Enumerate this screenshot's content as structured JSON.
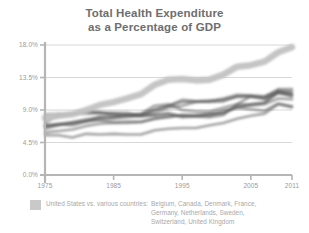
{
  "title": {
    "line1": "Total Health Expenditure",
    "line2": "as a Percentage of GDP"
  },
  "legend": {
    "swatch_color": "#c9c9c9",
    "label": "United States vs. various countries:",
    "countries": "Belgium, Canada, Denmark, France, Germany, Netherlands, Sweden, Switzerland, United Kingdom"
  },
  "axis": {
    "y_ticks": [
      "18.0%",
      "13.5%",
      "9.0%",
      "4.5%",
      "0.0%"
    ],
    "x_ticks": [
      "1975",
      "1985",
      "1995",
      "2005",
      "2011"
    ]
  },
  "colors": {
    "us_line": "#c2c2c2",
    "comparison_line": "#5a5a5a",
    "axis": "#b5b5b5",
    "gridline": "#d8d8d8",
    "title": "#6e6e6e",
    "tick_label": "#9a9a9a",
    "legend_text": "#a8a8a8",
    "background": "#ffffff"
  },
  "chart_data": {
    "type": "line",
    "title": "Total Health Expenditure as a Percentage of GDP",
    "xlabel": "",
    "ylabel": "",
    "xlim": [
      1975,
      2011
    ],
    "ylim": [
      0,
      18
    ],
    "ytick_values": [
      18.0,
      13.5,
      9.0,
      4.5,
      0.0
    ],
    "xtick_values": [
      1975,
      1985,
      1995,
      2005,
      2011
    ],
    "grid": true,
    "legend_position": "below-left",
    "x": [
      1975,
      1977,
      1979,
      1981,
      1983,
      1985,
      1987,
      1989,
      1991,
      1993,
      1995,
      1997,
      1999,
      2001,
      2003,
      2005,
      2007,
      2009,
      2011
    ],
    "series": [
      {
        "name": "United States",
        "color": "#c2c2c2",
        "highlight": true,
        "values": [
          7.9,
          8.2,
          8.4,
          9.0,
          9.7,
          10.1,
          10.6,
          11.2,
          12.5,
          13.2,
          13.3,
          13.1,
          13.2,
          13.9,
          15.0,
          15.2,
          15.7,
          17.0,
          17.7
        ]
      },
      {
        "name": "Belgium",
        "color": "#5a5a5a",
        "values": [
          5.9,
          6.1,
          6.3,
          6.8,
          7.1,
          7.2,
          7.2,
          7.3,
          7.8,
          8.1,
          8.3,
          8.3,
          8.4,
          8.5,
          9.5,
          9.6,
          9.8,
          10.6,
          10.5
        ]
      },
      {
        "name": "Canada",
        "color": "#5a5a5a",
        "values": [
          6.8,
          7.0,
          6.9,
          7.4,
          8.1,
          8.0,
          8.3,
          8.5,
          9.6,
          9.8,
          9.0,
          8.8,
          8.8,
          9.3,
          9.8,
          9.8,
          10.0,
          11.4,
          11.2
        ]
      },
      {
        "name": "Denmark",
        "color": "#5a5a5a",
        "values": [
          7.9,
          8.1,
          8.5,
          8.7,
          8.6,
          8.5,
          8.3,
          8.3,
          8.3,
          8.6,
          8.1,
          8.2,
          8.5,
          8.7,
          9.3,
          9.8,
          10.0,
          11.5,
          10.9
        ]
      },
      {
        "name": "France",
        "color": "#5a5a5a",
        "values": [
          6.4,
          6.9,
          7.3,
          7.7,
          8.0,
          8.1,
          8.3,
          8.4,
          9.0,
          9.6,
          10.4,
          10.2,
          10.1,
          10.2,
          10.9,
          11.0,
          10.9,
          11.6,
          11.6
        ]
      },
      {
        "name": "Germany",
        "color": "#5a5a5a",
        "values": [
          8.4,
          8.5,
          8.4,
          8.5,
          8.6,
          8.6,
          8.6,
          8.2,
          9.1,
          9.6,
          10.1,
          10.2,
          10.3,
          10.4,
          10.8,
          10.8,
          10.5,
          11.7,
          11.3
        ]
      },
      {
        "name": "Netherlands",
        "color": "#5a5a5a",
        "values": [
          6.7,
          7.0,
          7.1,
          7.4,
          7.6,
          7.3,
          7.4,
          7.4,
          7.8,
          8.0,
          8.3,
          8.1,
          8.0,
          8.3,
          9.8,
          10.9,
          10.8,
          11.9,
          11.9
        ]
      },
      {
        "name": "Sweden",
        "color": "#5a5a5a",
        "values": [
          7.2,
          8.3,
          8.6,
          8.8,
          8.7,
          8.3,
          8.2,
          8.1,
          8.2,
          8.4,
          8.0,
          8.1,
          8.2,
          8.9,
          9.3,
          9.1,
          8.9,
          9.9,
          9.5
        ]
      },
      {
        "name": "Switzerland",
        "color": "#5a5a5a",
        "values": [
          6.9,
          7.1,
          7.3,
          7.5,
          7.7,
          7.8,
          8.0,
          8.2,
          8.6,
          9.3,
          9.6,
          10.1,
          10.2,
          10.6,
          11.1,
          11.0,
          10.6,
          11.3,
          11.0
        ]
      },
      {
        "name": "United Kingdom",
        "color": "#5a5a5a",
        "values": [
          5.5,
          5.5,
          5.2,
          5.7,
          5.6,
          5.7,
          5.6,
          5.6,
          6.2,
          6.4,
          6.5,
          6.5,
          6.9,
          7.2,
          7.8,
          8.2,
          8.5,
          9.8,
          9.4
        ]
      }
    ]
  }
}
